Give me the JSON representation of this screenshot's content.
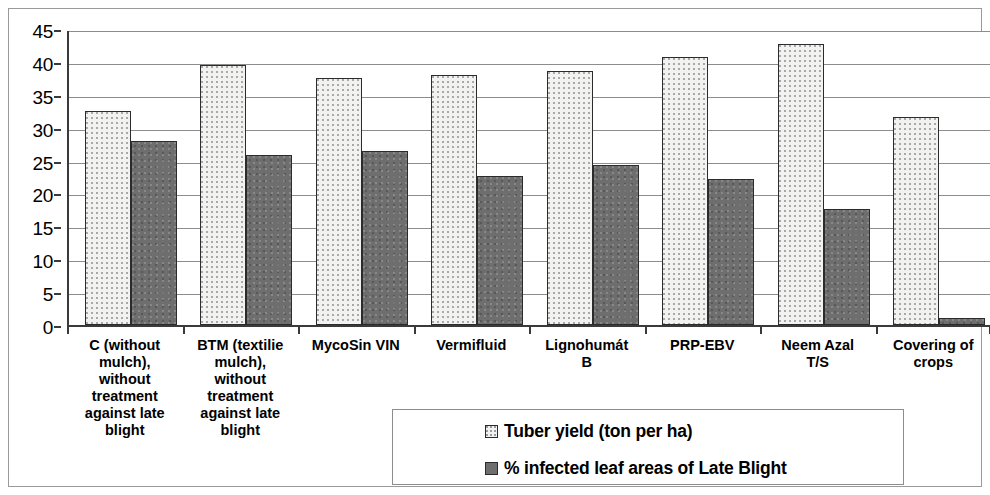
{
  "chart_data": {
    "type": "bar",
    "title": "",
    "xlabel": "",
    "ylabel": "",
    "ylim": [
      0,
      45
    ],
    "ytick_step": 5,
    "yticks": [
      "0",
      "5",
      "10",
      "15",
      "20",
      "25",
      "30",
      "35",
      "40",
      "45"
    ],
    "grid": true,
    "legend_position": "bottom",
    "categories": [
      "C (without mulch), without treatment against late blight",
      "BTM (textilie mulch), without treatment against late blight",
      "MycoSin VIN",
      "Vermifluid",
      "Lignohumát B",
      "PRP-EBV",
      "Neem Azal T/S",
      "Covering of crops"
    ],
    "category_label_lines": [
      [
        "C (without",
        "mulch),",
        "without",
        "treatment",
        "against late",
        "blight"
      ],
      [
        "BTM (textilie",
        "mulch),",
        "without",
        "treatment",
        "against late",
        "blight"
      ],
      [
        "MycoSin VIN"
      ],
      [
        "Vermifluid"
      ],
      [
        "Lignohumát",
        "B"
      ],
      [
        "PRP-EBV"
      ],
      [
        "Neem Azal",
        "T/S"
      ],
      [
        "Covering of",
        "crops"
      ]
    ],
    "series": [
      {
        "name": "Tuber yield (ton per ha)",
        "key": "series-yield",
        "color": "#f2f2f0",
        "values": [
          32.5,
          39.5,
          37.6,
          38.0,
          38.6,
          40.8,
          42.7,
          31.7
        ]
      },
      {
        "name": "% infected leaf areas of Late Blight",
        "key": "series-infected",
        "color": "#6e6e6e",
        "values": [
          28.0,
          25.8,
          26.5,
          22.7,
          24.3,
          22.2,
          17.6,
          1.0
        ]
      }
    ]
  },
  "legend": {
    "entries": [
      {
        "label": "Tuber yield (ton per ha)",
        "swatch": "series-yield"
      },
      {
        "label": "% infected leaf areas of Late Blight",
        "swatch": "series-infected"
      }
    ]
  }
}
